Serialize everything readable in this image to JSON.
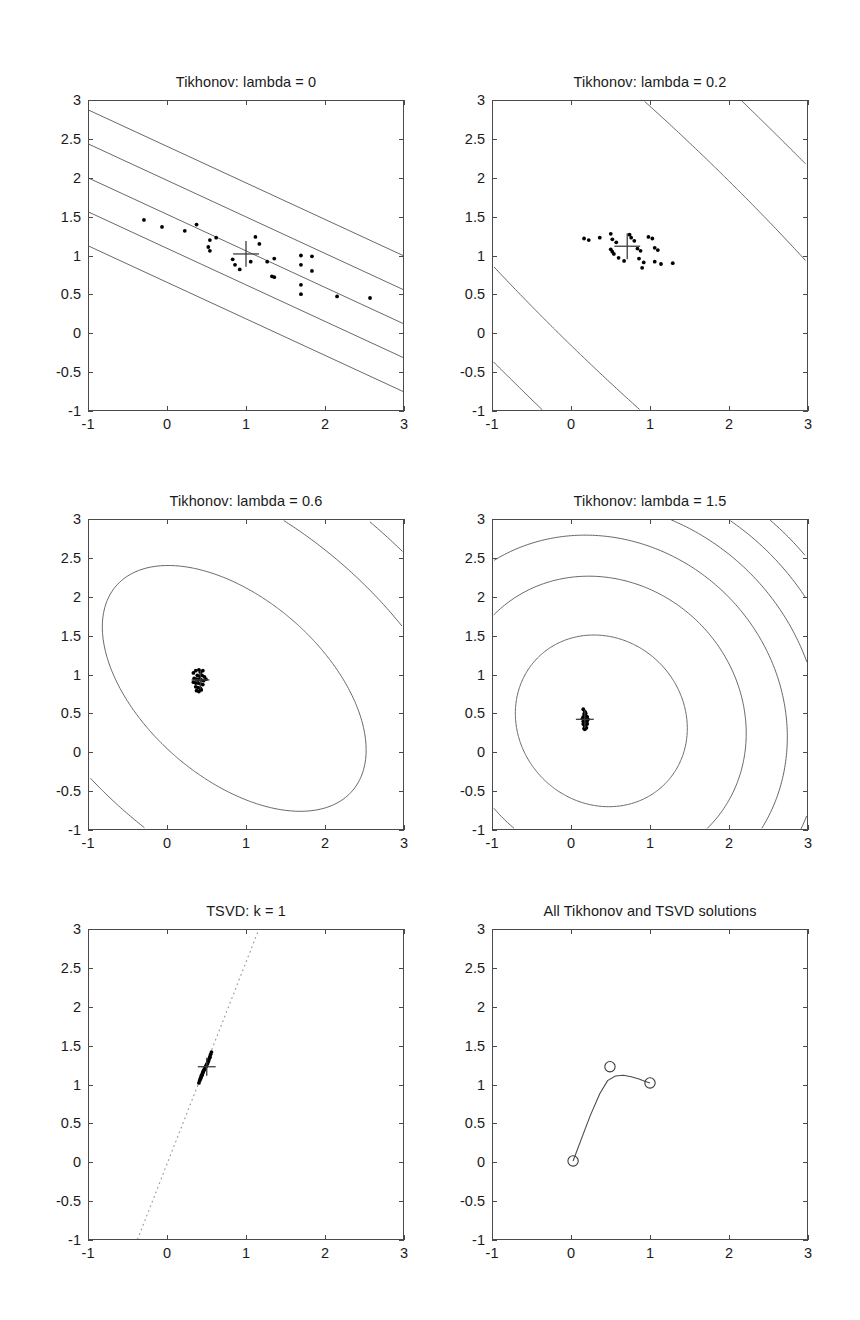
{
  "figure": {
    "width": 860,
    "height": 1320,
    "background": "#ffffff",
    "axis_color": "#4a4a4a",
    "text_color": "#1a1a1a",
    "contour_color": "#555555",
    "marker_color": "#000000"
  },
  "axes": {
    "xlim": [
      -1,
      3
    ],
    "ylim": [
      -1,
      3
    ],
    "xticks": [
      -1,
      0,
      1,
      2,
      3
    ],
    "xtick_labels": [
      "-1",
      "0",
      "1",
      "2",
      "3"
    ],
    "yticks": [
      -1,
      -0.5,
      0,
      0.5,
      1,
      1.5,
      2,
      2.5,
      3
    ],
    "ytick_labels": [
      "-1",
      "-0.5",
      "0",
      "0.5",
      "1",
      "1.5",
      "2",
      "2.5",
      "3"
    ],
    "grid": false,
    "xlabel": "",
    "ylabel": ""
  },
  "panels": [
    {
      "id": "tikhonov-lambda-0",
      "title": "Tikhonov: lambda = 0",
      "row": 0,
      "col": 0
    },
    {
      "id": "tikhonov-lambda-02",
      "title": "Tikhonov: lambda = 0.2",
      "row": 0,
      "col": 1
    },
    {
      "id": "tikhonov-lambda-06",
      "title": "Tikhonov: lambda = 0.6",
      "row": 1,
      "col": 0
    },
    {
      "id": "tikhonov-lambda-15",
      "title": "Tikhonov: lambda = 1.5",
      "row": 1,
      "col": 1
    },
    {
      "id": "tsvd-k-1",
      "title": "TSVD: k = 1",
      "row": 2,
      "col": 0
    },
    {
      "id": "all-solutions",
      "title": "All Tikhonov and TSVD solutions",
      "row": 2,
      "col": 1
    }
  ],
  "chart_data": [
    {
      "type": "scatter",
      "panel": "tikhonov-lambda-0",
      "title": "Tikhonov: lambda = 0",
      "xlabel": "",
      "ylabel": "",
      "xlim": [
        -1,
        3
      ],
      "ylim": [
        -1,
        3
      ],
      "grid": false,
      "legend": "none",
      "center_marker": {
        "x": 1.0,
        "y": 1.02,
        "symbol": "plus"
      },
      "points": [
        [
          -0.3,
          1.46
        ],
        [
          -0.07,
          1.37
        ],
        [
          0.22,
          1.32
        ],
        [
          0.37,
          1.4
        ],
        [
          0.54,
          1.2
        ],
        [
          0.62,
          1.23
        ],
        [
          0.52,
          1.11
        ],
        [
          0.54,
          1.06
        ],
        [
          1.12,
          1.24
        ],
        [
          1.17,
          1.15
        ],
        [
          0.83,
          0.95
        ],
        [
          0.86,
          0.88
        ],
        [
          0.92,
          0.82
        ],
        [
          1.27,
          0.92
        ],
        [
          1.36,
          0.96
        ],
        [
          1.33,
          0.73
        ],
        [
          1.36,
          0.72
        ],
        [
          1.7,
          1.0
        ],
        [
          1.84,
          0.99
        ],
        [
          1.7,
          0.88
        ],
        [
          1.84,
          0.8
        ],
        [
          1.7,
          0.62
        ],
        [
          1.7,
          0.5
        ],
        [
          2.16,
          0.47
        ],
        [
          2.58,
          0.45
        ],
        [
          1.06,
          0.92
        ]
      ],
      "contours": {
        "description": "near-parallel diagonal level lines of an ill-conditioned quadratic, slope ~ -0.47",
        "slope": -0.47,
        "line_count": 14,
        "spacing": 0.42
      }
    },
    {
      "type": "scatter",
      "panel": "tikhonov-lambda-02",
      "title": "Tikhonov: lambda = 0.2",
      "xlabel": "",
      "ylabel": "",
      "xlim": [
        -1,
        3
      ],
      "ylim": [
        -1,
        3
      ],
      "grid": false,
      "legend": "none",
      "center_marker": {
        "x": 0.71,
        "y": 1.12,
        "symbol": "plus"
      },
      "points": [
        [
          0.16,
          1.22
        ],
        [
          0.22,
          1.2
        ],
        [
          0.36,
          1.23
        ],
        [
          0.5,
          1.28
        ],
        [
          0.52,
          1.21
        ],
        [
          0.57,
          1.17
        ],
        [
          0.5,
          1.08
        ],
        [
          0.52,
          1.05
        ],
        [
          0.54,
          1.02
        ],
        [
          0.6,
          0.97
        ],
        [
          0.67,
          0.93
        ],
        [
          0.74,
          1.27
        ],
        [
          0.76,
          1.23
        ],
        [
          0.8,
          1.19
        ],
        [
          0.84,
          1.09
        ],
        [
          0.88,
          1.06
        ],
        [
          0.86,
          0.96
        ],
        [
          0.92,
          0.91
        ],
        [
          0.9,
          0.84
        ],
        [
          0.98,
          1.24
        ],
        [
          1.03,
          1.22
        ],
        [
          1.06,
          1.1
        ],
        [
          1.1,
          1.07
        ],
        [
          1.06,
          0.92
        ],
        [
          1.14,
          0.89
        ],
        [
          1.29,
          0.9
        ]
      ],
      "contours": {
        "description": "gently curved diagonal level lines, elliptical regularized quadratic",
        "line_count": 12,
        "spacing": 0.4
      }
    },
    {
      "type": "scatter",
      "panel": "tikhonov-lambda-06",
      "title": "Tikhonov: lambda = 0.6",
      "xlabel": "",
      "ylabel": "",
      "xlim": [
        -1,
        3
      ],
      "ylim": [
        -1,
        3
      ],
      "grid": false,
      "legend": "none",
      "center_marker": {
        "x": 0.42,
        "y": 0.93,
        "symbol": "plus"
      },
      "points": [
        [
          0.33,
          1.02
        ],
        [
          0.36,
          1.05
        ],
        [
          0.4,
          1.06
        ],
        [
          0.42,
          1.03
        ],
        [
          0.45,
          1.05
        ],
        [
          0.38,
          0.99
        ],
        [
          0.41,
          0.98
        ],
        [
          0.44,
          0.99
        ],
        [
          0.47,
          0.97
        ],
        [
          0.34,
          0.95
        ],
        [
          0.37,
          0.94
        ],
        [
          0.4,
          0.94
        ],
        [
          0.43,
          0.93
        ],
        [
          0.46,
          0.92
        ],
        [
          0.49,
          0.94
        ],
        [
          0.33,
          0.9
        ],
        [
          0.36,
          0.89
        ],
        [
          0.39,
          0.89
        ],
        [
          0.42,
          0.88
        ],
        [
          0.45,
          0.87
        ],
        [
          0.36,
          0.84
        ],
        [
          0.39,
          0.83
        ],
        [
          0.42,
          0.82
        ],
        [
          0.37,
          0.79
        ],
        [
          0.4,
          0.78
        ],
        [
          0.43,
          0.8
        ]
      ],
      "contours": {
        "description": "concentric tilted ellipses centered near (0.8, 0.9)",
        "line_count": 6
      }
    },
    {
      "type": "scatter",
      "panel": "tikhonov-lambda-15",
      "title": "Tikhonov: lambda = 1.5",
      "xlabel": "",
      "ylabel": "",
      "xlim": [
        -1,
        3
      ],
      "ylim": [
        -1,
        3
      ],
      "grid": false,
      "legend": "none",
      "center_marker": {
        "x": 0.17,
        "y": 0.42,
        "symbol": "plus"
      },
      "points": [
        [
          0.15,
          0.55
        ],
        [
          0.17,
          0.52
        ],
        [
          0.16,
          0.49
        ],
        [
          0.18,
          0.47
        ],
        [
          0.15,
          0.45
        ],
        [
          0.17,
          0.44
        ],
        [
          0.19,
          0.43
        ],
        [
          0.16,
          0.42
        ],
        [
          0.18,
          0.41
        ],
        [
          0.2,
          0.4
        ],
        [
          0.15,
          0.39
        ],
        [
          0.17,
          0.38
        ],
        [
          0.19,
          0.37
        ],
        [
          0.16,
          0.35
        ],
        [
          0.18,
          0.34
        ],
        [
          0.17,
          0.32
        ],
        [
          0.19,
          0.31
        ],
        [
          0.16,
          0.3
        ],
        [
          0.18,
          0.46
        ],
        [
          0.2,
          0.45
        ],
        [
          0.14,
          0.43
        ],
        [
          0.21,
          0.42
        ],
        [
          0.15,
          0.36
        ],
        [
          0.2,
          0.36
        ],
        [
          0.17,
          0.29
        ],
        [
          0.18,
          0.5
        ]
      ],
      "contours": {
        "description": "concentric near-circular contours centered near (0.4, 0.4)",
        "line_count": 6
      }
    },
    {
      "type": "scatter",
      "panel": "tsvd-k-1",
      "title": "TSVD: k = 1",
      "xlabel": "",
      "ylabel": "",
      "xlim": [
        -1,
        3
      ],
      "ylim": [
        -1,
        3
      ],
      "grid": false,
      "legend": "none",
      "center_marker": {
        "x": 0.5,
        "y": 1.23,
        "symbol": "plus"
      },
      "dotted_line": {
        "from": [
          -0.38,
          -1.0
        ],
        "to": [
          1.16,
          3.0
        ],
        "style": "dotted"
      },
      "points": [
        [
          0.4,
          1.02
        ],
        [
          0.41,
          1.05
        ],
        [
          0.42,
          1.08
        ],
        [
          0.43,
          1.11
        ],
        [
          0.44,
          1.13
        ],
        [
          0.45,
          1.16
        ],
        [
          0.46,
          1.18
        ],
        [
          0.47,
          1.2
        ],
        [
          0.48,
          1.22
        ],
        [
          0.49,
          1.24
        ],
        [
          0.5,
          1.26
        ],
        [
          0.51,
          1.28
        ],
        [
          0.52,
          1.31
        ],
        [
          0.53,
          1.33
        ],
        [
          0.54,
          1.36
        ],
        [
          0.55,
          1.39
        ],
        [
          0.56,
          1.42
        ],
        [
          0.45,
          1.15
        ],
        [
          0.47,
          1.19
        ],
        [
          0.49,
          1.23
        ],
        [
          0.51,
          1.27
        ],
        [
          0.43,
          1.1
        ],
        [
          0.44,
          1.12
        ],
        [
          0.52,
          1.3
        ],
        [
          0.54,
          1.35
        ],
        [
          0.42,
          1.07
        ]
      ]
    },
    {
      "type": "line",
      "panel": "all-solutions",
      "title": "All Tikhonov and TSVD solutions",
      "xlabel": "",
      "ylabel": "",
      "xlim": [
        -1,
        3
      ],
      "ylim": [
        -1,
        3
      ],
      "grid": false,
      "legend": "none",
      "markers": "circle",
      "marked_points": [
        {
          "x": 0.02,
          "y": 0.01,
          "label": ""
        },
        {
          "x": 0.49,
          "y": 1.23,
          "label": ""
        },
        {
          "x": 1.0,
          "y": 1.02,
          "label": ""
        }
      ],
      "path": [
        [
          0.02,
          0.01
        ],
        [
          0.12,
          0.28
        ],
        [
          0.24,
          0.6
        ],
        [
          0.36,
          0.88
        ],
        [
          0.46,
          1.05
        ],
        [
          0.56,
          1.11
        ],
        [
          0.66,
          1.12
        ],
        [
          0.76,
          1.1
        ],
        [
          0.86,
          1.07
        ],
        [
          0.94,
          1.04
        ],
        [
          1.0,
          1.02
        ]
      ]
    }
  ]
}
